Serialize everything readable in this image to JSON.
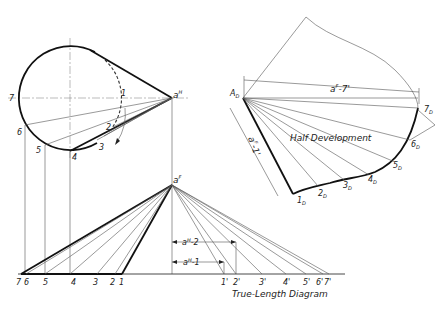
{
  "figure": {
    "top_view": {
      "apex_label": "a",
      "apex_sup": "H",
      "points": [
        "1",
        "2",
        "3",
        "4",
        "5",
        "6",
        "7"
      ]
    },
    "front_view": {
      "apex_label": "a",
      "apex_sup": "F",
      "base_points": [
        "7",
        "6",
        "5",
        "4",
        "3",
        "2",
        "1"
      ]
    },
    "true_length": {
      "title": "True-Length Diagram",
      "points": [
        "1'",
        "2'",
        "3'",
        "4'",
        "5'",
        "6'",
        "7'"
      ],
      "dim_1": {
        "base": "a",
        "sup": "H",
        "suffix": "-1"
      },
      "dim_2": {
        "base": "a",
        "sup": "H",
        "suffix": "-2"
      }
    },
    "development": {
      "title": "Half Development",
      "origin_label": "A",
      "origin_sub": "D",
      "points": [
        {
          "n": "1",
          "sub": "D"
        },
        {
          "n": "2",
          "sub": "D"
        },
        {
          "n": "3",
          "sub": "D"
        },
        {
          "n": "4",
          "sub": "D"
        },
        {
          "n": "5",
          "sub": "D"
        },
        {
          "n": "6",
          "sub": "D"
        },
        {
          "n": "7",
          "sub": "D"
        }
      ],
      "dim_top": {
        "base": "a",
        "sup": "F",
        "suffix": "-7'"
      },
      "dim_side": {
        "base": "a",
        "sup": "F",
        "suffix": "-1'"
      }
    }
  }
}
